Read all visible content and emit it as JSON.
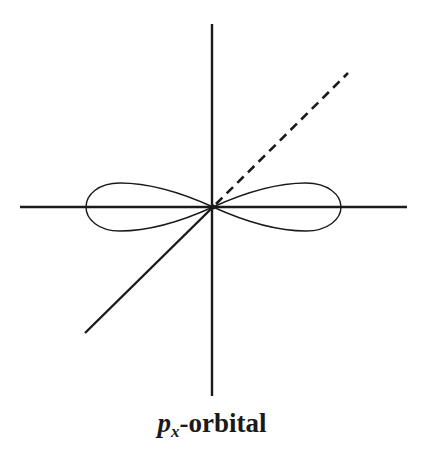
{
  "diagram": {
    "caption": {
      "main_symbol": "p",
      "subscript": "x",
      "suffix": "-orbital"
    },
    "colors": {
      "stroke": "#1a1a1a",
      "background": "#ffffff"
    },
    "axes": {
      "origin": [
        213,
        207
      ],
      "horizontal": {
        "x1": 20,
        "y1": 207,
        "x2": 407,
        "y2": 207,
        "style": "solid"
      },
      "vertical": {
        "x1": 212,
        "y1": 24,
        "x2": 212,
        "y2": 396,
        "style": "solid"
      },
      "diagonal_front": {
        "x1": 213,
        "y1": 207,
        "x2": 85,
        "y2": 333,
        "style": "solid"
      },
      "diagonal_back": {
        "x1": 213,
        "y1": 207,
        "x2": 348,
        "y2": 73,
        "style": "dashed"
      }
    },
    "lobes": [
      {
        "side": "left",
        "tip_x": 86,
        "top_y": 183,
        "bottom_y": 231
      },
      {
        "side": "right",
        "tip_x": 341,
        "top_y": 183,
        "bottom_y": 231
      }
    ]
  }
}
